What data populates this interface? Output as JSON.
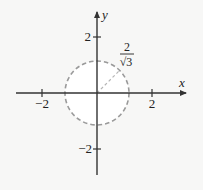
{
  "diagram": {
    "type": "coordinate-plane-with-circle",
    "axes": {
      "x_label": "x",
      "y_label": "y",
      "x_ticks": [
        {
          "value": -2,
          "label": "−2"
        },
        {
          "value": 2,
          "label": "2"
        }
      ],
      "y_ticks": [
        {
          "value": 2,
          "label": "2"
        },
        {
          "value": -2,
          "label": "−2"
        }
      ]
    },
    "circle": {
      "center": [
        0,
        0
      ],
      "radius_label_numerator": "2",
      "radius_label_denominator": "√3",
      "style": "dashed"
    },
    "colors": {
      "axis": "#333333",
      "circle": "#9a9a9a",
      "background": "#f7f7f6"
    }
  }
}
